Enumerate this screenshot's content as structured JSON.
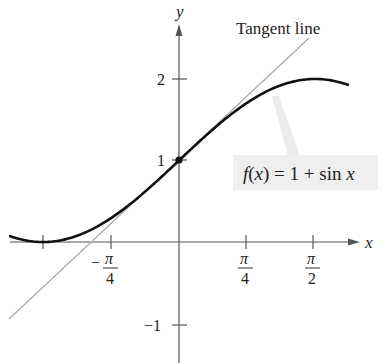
{
  "chart_data": {
    "type": "line",
    "title": "",
    "xlabel": "x",
    "ylabel": "y",
    "xlim": [
      -1.95,
      1.95
    ],
    "ylim": [
      -1.4,
      2.6
    ],
    "grid": false,
    "x_ticks": [
      {
        "value": -1.5708,
        "label": ""
      },
      {
        "value": -0.7854,
        "label_num": "π",
        "label_den": "4",
        "sign": "−"
      },
      {
        "value": 0.7854,
        "label_num": "π",
        "label_den": "4",
        "sign": ""
      },
      {
        "value": 1.5708,
        "label_num": "π",
        "label_den": "2",
        "sign": ""
      }
    ],
    "y_ticks": [
      {
        "value": 2,
        "label": "2"
      },
      {
        "value": 1,
        "label": "1"
      },
      {
        "value": -1,
        "label": "−1"
      }
    ],
    "series": [
      {
        "name": "f(x) = 1 + sin x",
        "expression": "1 + sin(x)",
        "x_range": [
          -1.95,
          1.95
        ],
        "style": "thick black curve"
      },
      {
        "name": "Tangent line",
        "expression": "1 + x",
        "x_range": [
          -1.95,
          1.5
        ],
        "style": "thin gray line"
      }
    ],
    "points": [
      {
        "x": 0,
        "y": 1,
        "label": "point of tangency"
      }
    ],
    "annotations": [
      {
        "text": "Tangent line",
        "position": "top right, above line end"
      },
      {
        "text": "f(x) = 1 + sin x",
        "position": "right, boxed label with leader to curve"
      }
    ]
  },
  "labels": {
    "tangent": "Tangent line",
    "function": "f(x) = 1 + sin x",
    "x_axis": "x",
    "y_axis": "y",
    "y_tick_2": "2",
    "y_tick_1": "1",
    "y_tick_neg1": "−1",
    "x_tick_neg_pi4_sign": "−",
    "x_tick_neg_pi4_num": "π",
    "x_tick_neg_pi4_den": "4",
    "x_tick_pi4_num": "π",
    "x_tick_pi4_den": "4",
    "x_tick_pi2_num": "π",
    "x_tick_pi2_den": "2"
  },
  "colors": {
    "curve": "#111111",
    "tangent": "#aaaaaa",
    "axis": "#555555",
    "label_box": "#efefef"
  }
}
